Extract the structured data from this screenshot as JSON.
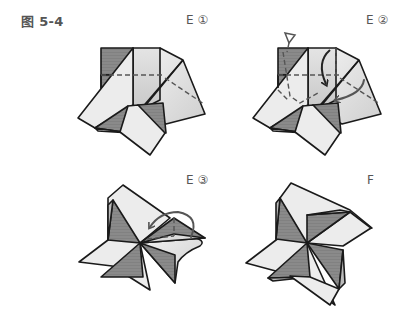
{
  "figure": {
    "title": "图 5-4"
  },
  "steps": [
    {
      "id": "E1",
      "label": "E ①",
      "description": "Partially folded model with dashed fold lines"
    },
    {
      "id": "E2",
      "label": "E ②",
      "description": "Valley folds with curved arrows and a push-in (triangle) symbol"
    },
    {
      "id": "E3",
      "label": "E ③",
      "description": "Pinwheel nearly complete, last flap tucked with curved arrow"
    },
    {
      "id": "F",
      "label": "F",
      "description": "Finished four-blade pinwheel"
    }
  ],
  "colors": {
    "paper_light": "#ececec",
    "paper_shade": "#d9d9d9",
    "paper_dark": "#8c8c8c",
    "outline": "#1a1a1a",
    "fold_line": "#555555",
    "label_text": "#555555"
  }
}
